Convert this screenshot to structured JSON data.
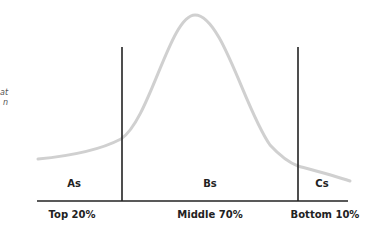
{
  "left_fragments": [
    "at",
    "n"
  ],
  "segments": [
    {
      "name": "As",
      "label": "Top 20%"
    },
    {
      "name": "Bs",
      "label": "Middle 70%"
    },
    {
      "name": "Cs",
      "label": "Bottom 10%"
    }
  ],
  "colors": {
    "curve": "#cfcfcf",
    "lines": "#222222"
  }
}
